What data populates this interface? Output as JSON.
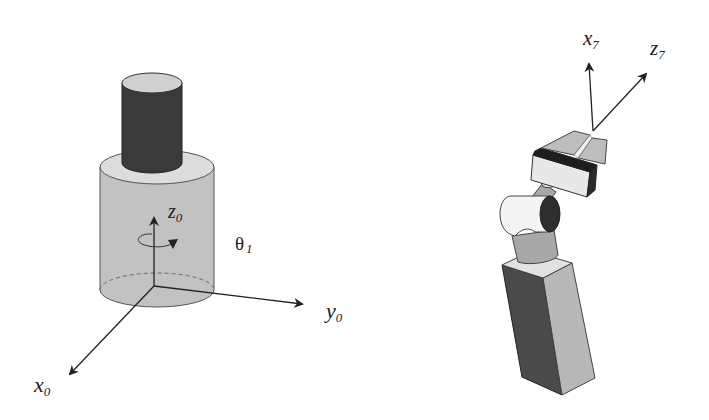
{
  "figure": {
    "colors": {
      "base_cylinder_side": "#c2c2c2",
      "base_cylinder_top": "#dcdcdc",
      "post_side": "#3a3a3a",
      "post_top": "#d0d0d0",
      "arrow": "#222222",
      "link_dark": "#4a4a4a",
      "link_light": "#b8b8b8",
      "link_top": "#e2e2e2",
      "joint_white": "#f4f4f4",
      "joint_face": "#2e2e2e"
    },
    "base_frame": {
      "axes": [
        {
          "name": "z",
          "subscript": "0"
        },
        {
          "name": "y",
          "subscript": "0"
        },
        {
          "name": "x",
          "subscript": "0"
        }
      ],
      "joint_angle": {
        "symbol": "θ",
        "subscript": "1"
      }
    },
    "end_effector_frame": {
      "axes": [
        {
          "name": "x",
          "subscript": "7"
        },
        {
          "name": "z",
          "subscript": "7"
        }
      ]
    }
  }
}
